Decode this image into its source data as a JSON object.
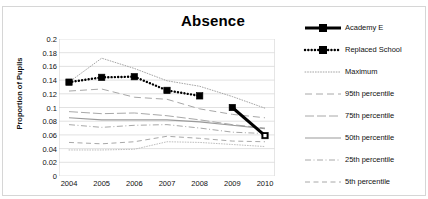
{
  "top_strip": {
    "ghost_text": ""
  },
  "chart_data": {
    "type": "line",
    "title": "Absence",
    "xlabel": "",
    "ylabel": "Proportion of Pupils",
    "categories": [
      "2004",
      "2005",
      "2006",
      "2007",
      "2008",
      "2009",
      "2010"
    ],
    "x": [
      2004,
      2005,
      2006,
      2007,
      2008,
      2009,
      2010
    ],
    "ylim": [
      0,
      0.2
    ],
    "yticks": [
      0,
      0.02,
      0.04,
      0.06,
      0.08,
      0.1,
      0.12,
      0.14,
      0.16,
      0.18,
      0.2
    ],
    "ytick_labels": [
      "0",
      "0.02",
      "0.04",
      "0.06",
      "0.08",
      "0.1",
      "0.12",
      "0.14",
      "0.16",
      "0.18",
      "0.2"
    ],
    "grid": true,
    "grid_axis": "y",
    "legend_position": "right",
    "series": [
      {
        "name": "Academy E",
        "style": "solid-thick-marker",
        "color": "#000000",
        "x": [
          2009,
          2010
        ],
        "values": [
          0.1,
          0.059
        ]
      },
      {
        "name": "Replaced School",
        "style": "dotted-thick-marker",
        "color": "#000000",
        "x": [
          2004,
          2005,
          2006,
          2007,
          2008
        ],
        "values": [
          0.137,
          0.144,
          0.145,
          0.125,
          0.117
        ]
      },
      {
        "name": "Maximum",
        "style": "fine-dotted",
        "color": "#9a9a9a",
        "x": [
          2004,
          2005,
          2006,
          2007,
          2008,
          2009,
          2010
        ],
        "values": [
          0.137,
          0.172,
          0.157,
          0.139,
          0.131,
          0.116,
          0.099
        ]
      },
      {
        "name": "95th percentile",
        "style": "long-dash",
        "color": "#a8a8a8",
        "x": [
          2004,
          2005,
          2006,
          2007,
          2008,
          2009,
          2010
        ],
        "values": [
          0.124,
          0.127,
          0.115,
          0.112,
          0.098,
          0.09,
          0.085
        ]
      },
      {
        "name": "75th percentile",
        "style": "dash-dot",
        "color": "#a8a8a8",
        "x": [
          2004,
          2005,
          2006,
          2007,
          2008,
          2009,
          2010
        ],
        "values": [
          0.094,
          0.091,
          0.092,
          0.088,
          0.082,
          0.075,
          0.07
        ]
      },
      {
        "name": "50th percentile",
        "style": "solid-thin",
        "color": "#9a9a9a",
        "x": [
          2004,
          2005,
          2006,
          2007,
          2008,
          2009,
          2010
        ],
        "values": [
          0.085,
          0.082,
          0.082,
          0.082,
          0.079,
          0.074,
          0.069
        ]
      },
      {
        "name": "25th  percentile",
        "style": "dash-dot-thin",
        "color": "#a8a8a8",
        "x": [
          2004,
          2005,
          2006,
          2007,
          2008,
          2009,
          2010
        ],
        "values": [
          0.075,
          0.071,
          0.074,
          0.075,
          0.07,
          0.064,
          0.062
        ]
      },
      {
        "name": "5th percentile",
        "style": "medium-dash",
        "color": "#a8a8a8",
        "x": [
          2004,
          2005,
          2006,
          2007,
          2008,
          2009,
          2010
        ],
        "values": [
          0.049,
          0.047,
          0.05,
          0.058,
          0.055,
          0.051,
          0.05
        ]
      },
      {
        "name": "Minimum",
        "style": "fine-dotted-low",
        "color": "#b5b5b5",
        "x": [
          2004,
          2005,
          2006,
          2007,
          2008,
          2009,
          2010
        ],
        "values": [
          0.038,
          0.038,
          0.039,
          0.05,
          0.049,
          0.046,
          0.043
        ]
      }
    ]
  },
  "legend": {
    "items": [
      {
        "label": "Academy E",
        "key": "solid-thick-marker"
      },
      {
        "label": "Replaced School",
        "key": "dotted-thick-marker"
      },
      {
        "label": "Maximum",
        "key": "fine-dotted"
      },
      {
        "label": "95th percentile",
        "key": "long-dash"
      },
      {
        "label": "75th percentile",
        "key": "dash-dot"
      },
      {
        "label": "50th percentile",
        "key": "solid-thin"
      },
      {
        "label": "25th  percentile",
        "key": "dash-dot-thin"
      },
      {
        "label": "5th percentile",
        "key": "medium-dash"
      }
    ]
  },
  "colors": {
    "series_black": "#000000",
    "series_grey": "#a8a8a8",
    "gridline": "#d9d9d9",
    "border": "#d6d6d6",
    "text": "#111111"
  }
}
